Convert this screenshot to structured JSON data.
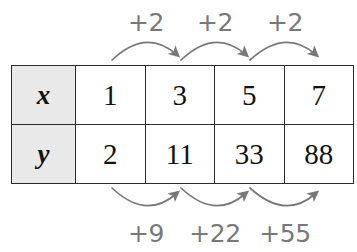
{
  "table": {
    "rows": [
      {
        "header": "x",
        "values": [
          "1",
          "3",
          "5",
          "7"
        ]
      },
      {
        "header": "y",
        "values": [
          "2",
          "11",
          "33",
          "88"
        ]
      }
    ]
  },
  "annotations": {
    "top": {
      "labels": [
        "+2",
        "+2",
        "+2"
      ],
      "direction": "left-to-right",
      "arrow_style": "curved-arc-above",
      "color": "#787878"
    },
    "bottom": {
      "labels": [
        "+9",
        "+22",
        "+55"
      ],
      "direction": "left-to-right",
      "arrow_style": "curved-arc-below",
      "color": "#787878"
    }
  },
  "colors": {
    "header_fill": "#e9e9e9",
    "cell_fill": "#ffffff",
    "border": "#2b2b2b",
    "annotation": "#787878",
    "background": "#ffffff"
  }
}
